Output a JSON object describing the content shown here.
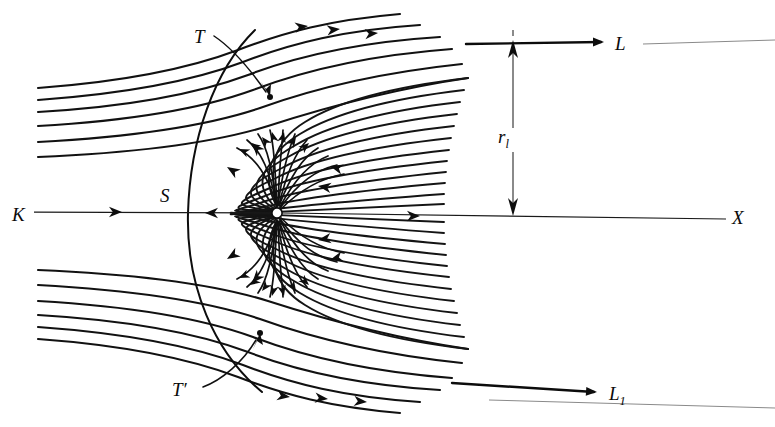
{
  "figure": {
    "kind": "streamline-flow-diagram",
    "background_color": "#ffffff",
    "line_color": "#111111",
    "faint_line_color": "#8a8a8a",
    "width": 775,
    "height": 427
  },
  "labels": {
    "incoming_axis": "K",
    "separatrix": "S",
    "tangent_upper": "T",
    "tangent_lower": "T′",
    "asymptote_upper": "L",
    "asymptote_lower_base": "L",
    "asymptote_lower_sub": "1",
    "horizontal_axis": "X",
    "radius_base": "r",
    "radius_sub": "l"
  },
  "geometry": {
    "focus_x": 277,
    "focus_y": 213,
    "axis_y": 213,
    "separatrix_apex_x": 188,
    "upper_asymptote_y": 42,
    "lower_asymptote_y": 392,
    "dimension_x": 513,
    "streamline_count_upper_left": 6,
    "streamline_count_lower_left": 6,
    "inner_fan_count": 11
  },
  "annotations": {
    "T_dot_x": 270,
    "T_dot_y": 97,
    "T_label_x": 199,
    "T_label_y": 40,
    "Tp_dot_x": 260,
    "Tp_dot_y": 333,
    "Tp_label_x": 178,
    "Tp_label_y": 394,
    "S_label_x": 162,
    "S_label_y": 201,
    "K_label_x": 12,
    "K_label_y": 220,
    "X_label_x": 731,
    "X_label_y": 221,
    "L_label_x": 614,
    "L_label_y": 48,
    "L1_label_x": 608,
    "L1_label_y": 398,
    "rl_label_x": 499,
    "rl_label_y": 138
  }
}
